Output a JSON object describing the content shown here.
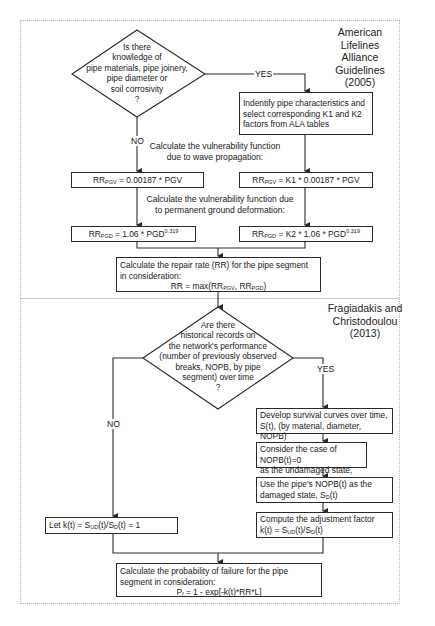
{
  "section1": {
    "title_lines": [
      "American Lifelines",
      "Alliance",
      "Guidelines (2005)"
    ],
    "decision": {
      "lines": [
        "Is there",
        "knowledge of",
        "pipe materials, pipe joinery,",
        "pipe diameter or",
        "soil corrosivity",
        "?"
      ],
      "yes_label": "YES",
      "no_label": "NO"
    },
    "identify_box": {
      "lines": [
        "Indentify pipe characteristics and",
        "select corresponding K1 and K2",
        "factors from ALA tables"
      ]
    },
    "wave_label_lines": [
      "Calculate the vulnerability function",
      "due to wave propagation:"
    ],
    "pgd_label_lines": [
      "Calculate the vulnerability function due",
      "to permanent ground deformation:"
    ],
    "left_pgv": {
      "prefix": "RR",
      "sub": "PGV",
      "rest": " = 0.00187 * PGV"
    },
    "right_pgv": {
      "prefix": "RR",
      "sub": "PGV",
      "rest": " = K1 * 0.00187 * PGV"
    },
    "left_pgd": {
      "prefix": "RR",
      "sub": "PGD",
      "rest": " = 1.06 * PGD",
      "sup": "0.319"
    },
    "right_pgd": {
      "prefix": "RR",
      "sub": "PGD",
      "rest": " = K2 * 1.06 * PGD",
      "sup": "0.319"
    },
    "repair_box": {
      "line1": "Calculate the repair rate (RR) for the pipe segment",
      "line2": "in consideration:",
      "formula_prefix": "RR = max(RR",
      "sub1": "PGV",
      "mid": ", RR",
      "sub2": "PGD",
      "suffix": ")"
    }
  },
  "section2": {
    "title_lines": [
      "Fragiadakis and",
      "Christodoulou",
      "(2013)"
    ],
    "decision": {
      "lines": [
        "Are there",
        "historical records on",
        "the network's performance",
        "(number of previously observed",
        "breaks, NOPB, by pipe",
        "segment) over time",
        "?"
      ],
      "yes_label": "YES",
      "no_label": "NO"
    },
    "survival_box": {
      "lines": [
        "Develop survival curves over time,",
        "S(t), (by material, diameter, NOPB)"
      ]
    },
    "undamaged_box": {
      "line1": "Consider the case of NOPB(t)=0",
      "line2_prefix": "as the undamaged state, S",
      "sub": "UD",
      "line2_suffix": "(t)"
    },
    "damaged_box": {
      "line1": "Use the pipe's NOPB(t) as the",
      "line2_prefix": "damaged state, S",
      "sub": "D",
      "line2_suffix": "(t)"
    },
    "adjust_box": {
      "line1": "Compute the adjustment factor",
      "f_prefix": "k(t) = S",
      "sub1": "UD",
      "f_mid": "(t)/S",
      "sub2": "D",
      "f_suffix": "(t)"
    },
    "let_box": {
      "f_prefix": "Let k(t) = S",
      "sub1": "UD",
      "f_mid": "(t)/S",
      "sub2": "D",
      "f_suffix": "(t) = 1"
    },
    "failure_box": {
      "line1": "Calculate the probability of failure for the pipe",
      "line2": "segment in consideration:",
      "f_prefix": "P",
      "sub": "f",
      "f_rest": " = 1 - exp[-k(t)*RR*L]"
    }
  },
  "colors": {
    "line": "#2a2a2a",
    "frame": "#b8b8b8",
    "divider": "#c8c8c8"
  }
}
